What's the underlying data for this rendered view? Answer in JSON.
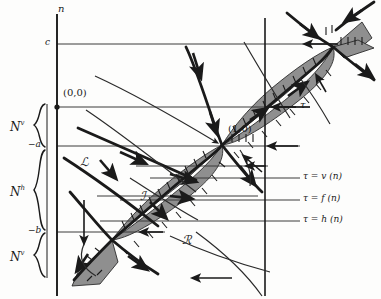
{
  "figure": {
    "type": "phase-portrait-diagram"
  },
  "axes": {
    "vertical_axis_label": "n",
    "horizontal_axis_label": "τ",
    "vertical_axis_x": 57,
    "horizontal_axis_y": 107,
    "second_vertical_axis_x": 265
  },
  "ticks": [
    {
      "label": "c",
      "y": 44,
      "name": "tick-c"
    },
    {
      "label": "−a",
      "y": 146,
      "name": "tick-minus-a"
    },
    {
      "label": "−b",
      "y": 232,
      "name": "tick-minus-b"
    }
  ],
  "points": [
    {
      "label": "(0,0)",
      "x": 57,
      "y": 107,
      "name": "origin-point"
    },
    {
      "label": "(1,0)",
      "x": 265,
      "y": 107,
      "name": "unit-point"
    }
  ],
  "equilibria": [
    {
      "name": "saddle-lower-left",
      "x": 112,
      "y": 240
    },
    {
      "name": "saddle-middle",
      "x": 222,
      "y": 145
    },
    {
      "name": "saddle-upper-right",
      "x": 333,
      "y": 47
    }
  ],
  "braces": [
    {
      "label": "N",
      "superscript": "v",
      "name": "brace-n-v-upper",
      "top": 104,
      "bottom": 148
    },
    {
      "label": "N",
      "superscript": "h",
      "name": "brace-n-h",
      "top": 150,
      "bottom": 230
    },
    {
      "label": "N",
      "superscript": "v",
      "name": "brace-n-v-lower",
      "top": 233,
      "bottom": 278
    }
  ],
  "regions": [
    {
      "label": "ℒ",
      "name": "region-L",
      "x": 84,
      "y": 162
    },
    {
      "label": "ℐ",
      "name": "region-I",
      "x": 143,
      "y": 196
    },
    {
      "label": "ℛ",
      "name": "region-R",
      "x": 186,
      "y": 240
    }
  ],
  "curve_labels": [
    {
      "label": "τ = v (n)",
      "name": "curve-label-tau-v",
      "y": 178
    },
    {
      "label": "τ = f (n)",
      "name": "curve-label-tau-f",
      "y": 200
    },
    {
      "label": "τ = h (n)",
      "name": "curve-label-tau-h",
      "y": 221
    }
  ],
  "colors": {
    "ink": "#1a1a1a",
    "shade_fill": "#8f8f8f",
    "thin_line": "#3a3a3a",
    "background": "#fdfdfc"
  }
}
